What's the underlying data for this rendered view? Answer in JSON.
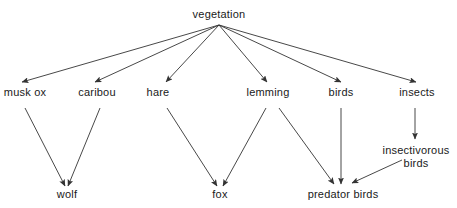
{
  "diagram": {
    "colors": {
      "line": "#333333",
      "text": "#1a1a1a",
      "background": "#ffffff"
    },
    "nodes": {
      "vegetation": {
        "label": "vegetation",
        "x": 219,
        "y": 8
      },
      "musk_ox": {
        "label": "musk ox",
        "x": 25,
        "y": 86
      },
      "caribou": {
        "label": "caribou",
        "x": 97,
        "y": 86
      },
      "hare": {
        "label": "hare",
        "x": 158,
        "y": 86
      },
      "lemming": {
        "label": "lemming",
        "x": 268,
        "y": 86
      },
      "birds": {
        "label": "birds",
        "x": 341,
        "y": 86
      },
      "insects": {
        "label": "insects",
        "x": 417,
        "y": 86
      },
      "insectivorous_birds": {
        "label_line1": "insectivorous",
        "label_line2": "birds",
        "x": 416,
        "y": 144
      },
      "wolf": {
        "label": "wolf",
        "x": 67,
        "y": 188
      },
      "fox": {
        "label": "fox",
        "x": 220,
        "y": 188
      },
      "predator_birds": {
        "label": "predator birds",
        "x": 343,
        "y": 188
      }
    },
    "edges": [
      {
        "from": "vegetation",
        "to": "musk_ox",
        "x1": 219,
        "y1": 25,
        "x2": 22,
        "y2": 82
      },
      {
        "from": "vegetation",
        "to": "caribou",
        "x1": 219,
        "y1": 25,
        "x2": 95,
        "y2": 82
      },
      {
        "from": "vegetation",
        "to": "hare",
        "x1": 219,
        "y1": 25,
        "x2": 166,
        "y2": 82
      },
      {
        "from": "vegetation",
        "to": "lemming",
        "x1": 219,
        "y1": 25,
        "x2": 267,
        "y2": 82
      },
      {
        "from": "vegetation",
        "to": "birds",
        "x1": 219,
        "y1": 25,
        "x2": 341,
        "y2": 82
      },
      {
        "from": "vegetation",
        "to": "insects",
        "x1": 219,
        "y1": 25,
        "x2": 416,
        "y2": 82
      },
      {
        "from": "musk_ox",
        "to": "wolf",
        "x1": 25,
        "y1": 108,
        "x2": 65,
        "y2": 186
      },
      {
        "from": "caribou",
        "to": "wolf",
        "x1": 100,
        "y1": 108,
        "x2": 68,
        "y2": 186
      },
      {
        "from": "hare",
        "to": "fox",
        "x1": 167,
        "y1": 108,
        "x2": 217,
        "y2": 186
      },
      {
        "from": "lemming",
        "to": "fox",
        "x1": 266,
        "y1": 108,
        "x2": 223,
        "y2": 186
      },
      {
        "from": "lemming",
        "to": "predator_birds",
        "x1": 279,
        "y1": 108,
        "x2": 334,
        "y2": 184
      },
      {
        "from": "birds",
        "to": "predator_birds",
        "x1": 341,
        "y1": 108,
        "x2": 341,
        "y2": 184
      },
      {
        "from": "insects",
        "to": "insectivorous_birds",
        "x1": 415,
        "y1": 108,
        "x2": 415,
        "y2": 139
      },
      {
        "from": "insectivorous_birds",
        "to": "predator_birds",
        "x1": 402,
        "y1": 160,
        "x2": 352,
        "y2": 183
      }
    ]
  }
}
